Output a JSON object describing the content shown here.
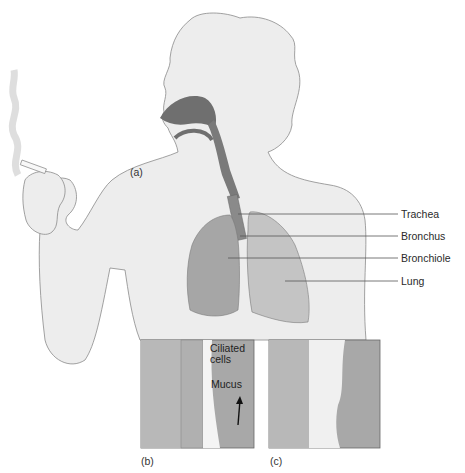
{
  "figure": {
    "panels": [
      {
        "id": "a",
        "label": "(a)"
      },
      {
        "id": "b",
        "label": "(b)"
      },
      {
        "id": "c",
        "label": "(c)"
      }
    ],
    "callouts_a": [
      {
        "text": "Trachea"
      },
      {
        "text": "Bronchus"
      },
      {
        "text": "Bronchiole"
      },
      {
        "text": "Lung"
      }
    ],
    "callouts_b": [
      {
        "text": "Ciliated cells"
      },
      {
        "text": "Mucus"
      }
    ],
    "colors": {
      "skin": "#ededed",
      "outline": "#8a8a8a",
      "airway": "#6f6f6f",
      "lung_left": "#a6a6a6",
      "lung_right": "#c4c4c4",
      "tissue": "#b8b8b8",
      "lumen": "#a8a8a8",
      "mucus": "#f4f4f4"
    }
  }
}
